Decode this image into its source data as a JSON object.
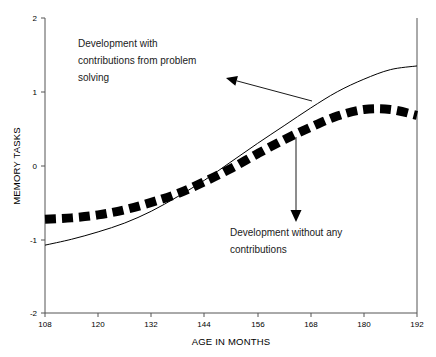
{
  "chart_data": {
    "type": "line",
    "title": "",
    "xlabel": "AGE IN MONTHS",
    "ylabel": "MEMORY TASKS",
    "xlim": [
      108,
      192
    ],
    "ylim": [
      -2,
      2
    ],
    "xticks": [
      108,
      120,
      132,
      144,
      156,
      168,
      180,
      192
    ],
    "yticks": [
      2,
      1,
      0,
      -1,
      -2
    ],
    "xtick_labels": [
      "108",
      "120",
      "132",
      "144",
      "156",
      "168",
      "180",
      "192"
    ],
    "ytick_labels": [
      "2",
      "1",
      "0",
      "-1",
      "-2"
    ],
    "grid": false,
    "legend": "none",
    "x": [
      108,
      114,
      120,
      126,
      132,
      138,
      144,
      150,
      156,
      162,
      168,
      174,
      180,
      186,
      192
    ],
    "series": [
      {
        "name": "Development with contributions from problem solving",
        "style": "thin-solid",
        "color": "#000000",
        "values": [
          -1.08,
          -1.0,
          -0.9,
          -0.78,
          -0.62,
          -0.42,
          -0.2,
          0.05,
          0.3,
          0.54,
          0.78,
          1.0,
          1.17,
          1.3,
          1.35
        ]
      },
      {
        "name": "Development without any contributions",
        "style": "thick-dashed",
        "color": "#000000",
        "values": [
          -0.73,
          -0.71,
          -0.67,
          -0.6,
          -0.5,
          -0.38,
          -0.22,
          -0.04,
          0.16,
          0.35,
          0.52,
          0.67,
          0.76,
          0.76,
          0.68
        ]
      }
    ],
    "annotations": [
      {
        "id": "annotation-upper",
        "lines": [
          "Development with",
          "contributions from problem",
          "solving"
        ],
        "text_x": 78,
        "text_y": 47,
        "arrow": {
          "x1": 312,
          "y1": 101,
          "x2": 226,
          "y2": 78
        }
      },
      {
        "id": "annotation-lower",
        "lines": [
          "Development without any",
          "contributions"
        ],
        "text_x": 230,
        "text_y": 236,
        "arrow": {
          "x1": 296,
          "y1": 137,
          "x2": 296,
          "y2": 222
        }
      }
    ],
    "colors": {
      "axis": "#555555",
      "ink": "#000000",
      "background": "#ffffff"
    }
  }
}
